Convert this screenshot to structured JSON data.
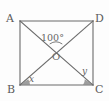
{
  "figure": {
    "type": "geometry-diagram",
    "shape": "rectangle-with-diagonals",
    "background_color": "#fdfdfd",
    "stroke_color": "#6b6b6b",
    "wedge_fill_color": "#8c8c8c",
    "text_color": "#5b5b5b",
    "vertices": [
      {
        "id": "A",
        "label": "A",
        "x": 20,
        "y": 21,
        "label_x": 6,
        "label_y": 13
      },
      {
        "id": "D",
        "label": "D",
        "x": 93,
        "y": 21,
        "label_x": 95,
        "label_y": 13
      },
      {
        "id": "B",
        "label": "B",
        "x": 20,
        "y": 85,
        "label_x": 7,
        "label_y": 84
      },
      {
        "id": "C",
        "label": "C",
        "x": 93,
        "y": 85,
        "label_x": 95,
        "label_y": 84
      }
    ],
    "center": {
      "id": "O",
      "label": "O",
      "x": 56,
      "y": 53,
      "label_x": 52,
      "label_y": 52
    },
    "sides": [
      {
        "id": "AD",
        "from": "A",
        "to": "D"
      },
      {
        "id": "DC",
        "from": "D",
        "to": "C"
      },
      {
        "id": "CB",
        "from": "C",
        "to": "B"
      },
      {
        "id": "BA",
        "from": "B",
        "to": "A"
      }
    ],
    "diagonals": [
      {
        "id": "AC",
        "from": "A",
        "to": "C"
      },
      {
        "id": "BD",
        "from": "B",
        "to": "D"
      }
    ],
    "angles": [
      {
        "id": "AOD",
        "label": "100°",
        "vertex": "O",
        "value": 100,
        "unit": "degrees",
        "label_x": 41,
        "label_y": 33,
        "arc": {
          "cx": 56,
          "cy": 53,
          "r": 11,
          "start_deg": 125,
          "end_deg": 55
        },
        "marked": true
      },
      {
        "id": "DBC",
        "label": "x",
        "vertex": "B",
        "value": null,
        "unit": "degrees",
        "label_x": 29,
        "label_y": 75,
        "wedge": {
          "cx": 20,
          "cy": 85,
          "r": 10
        },
        "marked": true
      },
      {
        "id": "ACB",
        "label": "y",
        "vertex": "C",
        "value": null,
        "unit": "degrees",
        "label_x": 82,
        "label_y": 67,
        "wedge": {
          "cx": 93,
          "cy": 85,
          "r": 10
        },
        "marked": true
      }
    ]
  }
}
